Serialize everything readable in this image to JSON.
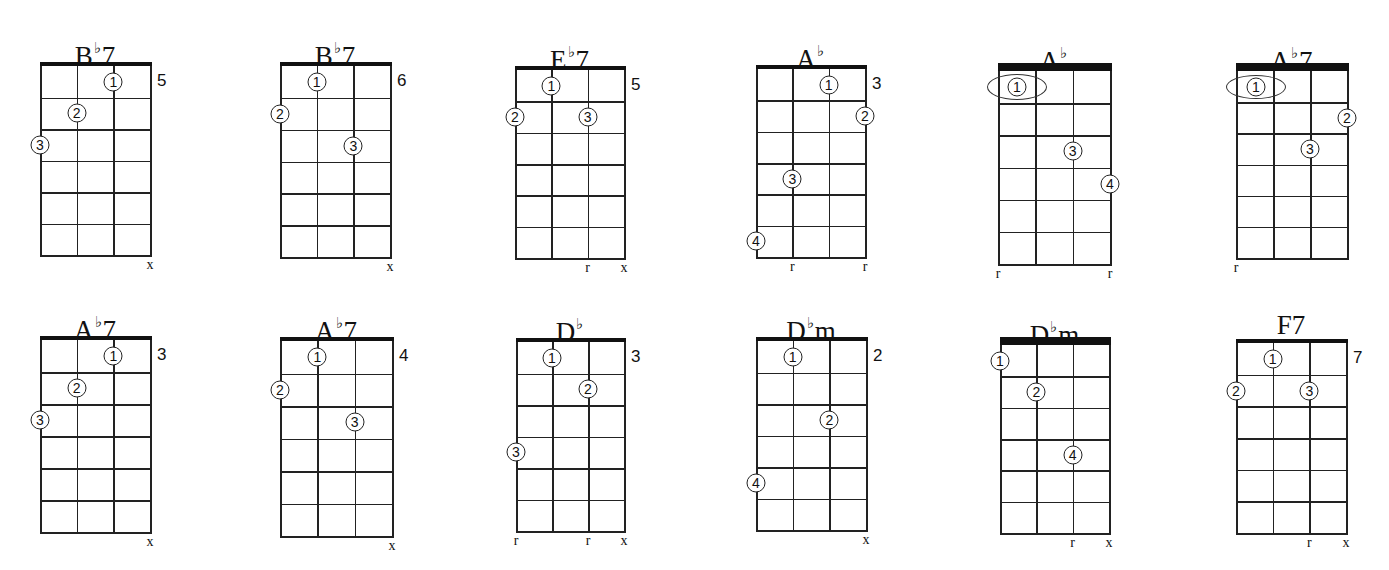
{
  "diagram": {
    "type": "ukulele-style chord chart grid",
    "strings": 4,
    "frets_shown": 6,
    "rows": 2,
    "columns": 6
  },
  "chords": [
    {
      "root": "B",
      "flat": true,
      "suffix": "7",
      "fret_label": "5",
      "grid": {
        "x0": 40,
        "x1": 150,
        "y0": 66,
        "y1": 255
      },
      "nut_thickness": 4,
      "fingers": [
        {
          "label": "1",
          "string": 3,
          "fret": 1
        },
        {
          "label": "2",
          "string": 2,
          "fret": 2
        },
        {
          "label": "3",
          "string": 1,
          "fret": 3
        }
      ],
      "markers": [
        {
          "string": 4,
          "text": "x"
        }
      ]
    },
    {
      "root": "B",
      "flat": true,
      "suffix": "7",
      "fret_label": "6",
      "grid": {
        "x0": 280,
        "x1": 390,
        "y0": 66,
        "y1": 257
      },
      "nut_thickness": 4,
      "fingers": [
        {
          "label": "1",
          "string": 2,
          "fret": 1
        },
        {
          "label": "2",
          "string": 1,
          "fret": 2
        },
        {
          "label": "3",
          "string": 3,
          "fret": 3
        }
      ],
      "markers": [
        {
          "string": 4,
          "text": "x"
        }
      ]
    },
    {
      "root": "E",
      "flat": true,
      "suffix": "7",
      "fret_label": "5",
      "grid": {
        "x0": 515,
        "x1": 624,
        "y0": 70,
        "y1": 258
      },
      "nut_thickness": 4,
      "fingers": [
        {
          "label": "1",
          "string": 2,
          "fret": 1
        },
        {
          "label": "2",
          "string": 1,
          "fret": 2
        },
        {
          "label": "3",
          "string": 3,
          "fret": 2
        }
      ],
      "markers": [
        {
          "string": 3,
          "text": "r"
        },
        {
          "string": 4,
          "text": "x"
        }
      ]
    },
    {
      "root": "A",
      "flat": true,
      "suffix": "",
      "fret_label": "3",
      "grid": {
        "x0": 756,
        "x1": 865,
        "y0": 69,
        "y1": 257
      },
      "nut_thickness": 4,
      "fingers": [
        {
          "label": "1",
          "string": 3,
          "fret": 1
        },
        {
          "label": "2",
          "string": 4,
          "fret": 2
        },
        {
          "label": "3",
          "string": 2,
          "fret": 4
        },
        {
          "label": "4",
          "string": 1,
          "fret": 6
        }
      ],
      "markers": [
        {
          "string": 2,
          "text": "r"
        },
        {
          "string": 4,
          "text": "r"
        }
      ]
    },
    {
      "root": "A",
      "flat": true,
      "suffix": "",
      "fret_label": "",
      "grid": {
        "x0": 998,
        "x1": 1110,
        "y0": 71,
        "y1": 264
      },
      "nut_thickness": 8,
      "barre": {
        "fret": 1,
        "cx": 1017,
        "w": 60,
        "h": 26
      },
      "fingers": [
        {
          "label": "1",
          "string": 1,
          "fret": 1,
          "offset_x": 19
        },
        {
          "label": "3",
          "string": 3,
          "fret": 3
        },
        {
          "label": "4",
          "string": 4,
          "fret": 4
        }
      ],
      "markers": [
        {
          "string": 1,
          "text": "r"
        },
        {
          "string": 4,
          "text": "r"
        }
      ]
    },
    {
      "root": "A",
      "flat": true,
      "suffix": "7",
      "fret_label": "",
      "grid": {
        "x0": 1236,
        "x1": 1347,
        "y0": 71,
        "y1": 258
      },
      "nut_thickness": 8,
      "barre": {
        "fret": 1,
        "cx": 1256,
        "w": 60,
        "h": 24
      },
      "fingers": [
        {
          "label": "1",
          "string": 1,
          "fret": 1,
          "offset_x": 20
        },
        {
          "label": "2",
          "string": 4,
          "fret": 2
        },
        {
          "label": "3",
          "string": 3,
          "fret": 3
        }
      ],
      "markers": [
        {
          "string": 1,
          "text": "r"
        }
      ]
    },
    {
      "root": "A",
      "flat": true,
      "suffix": "7",
      "fret_label": "3",
      "grid": {
        "x0": 40,
        "x1": 150,
        "y0": 340,
        "y1": 532
      },
      "nut_thickness": 4,
      "fingers": [
        {
          "label": "1",
          "string": 3,
          "fret": 1
        },
        {
          "label": "2",
          "string": 2,
          "fret": 2
        },
        {
          "label": "3",
          "string": 1,
          "fret": 3
        }
      ],
      "markers": [
        {
          "string": 4,
          "text": "x"
        }
      ]
    },
    {
      "root": "A",
      "flat": true,
      "suffix": "7",
      "fret_label": "4",
      "grid": {
        "x0": 280,
        "x1": 392,
        "y0": 341,
        "y1": 536
      },
      "nut_thickness": 4,
      "fingers": [
        {
          "label": "1",
          "string": 2,
          "fret": 1
        },
        {
          "label": "2",
          "string": 1,
          "fret": 2
        },
        {
          "label": "3",
          "string": 3,
          "fret": 3
        }
      ],
      "markers": [
        {
          "string": 4,
          "text": "x"
        }
      ]
    },
    {
      "root": "D",
      "flat": true,
      "suffix": "",
      "fret_label": "3",
      "grid": {
        "x0": 516,
        "x1": 624,
        "y0": 342,
        "y1": 531
      },
      "nut_thickness": 4,
      "fingers": [
        {
          "label": "1",
          "string": 2,
          "fret": 1
        },
        {
          "label": "2",
          "string": 3,
          "fret": 2
        },
        {
          "label": "3",
          "string": 1,
          "fret": 4
        }
      ],
      "markers": [
        {
          "string": 1,
          "text": "r"
        },
        {
          "string": 3,
          "text": "r"
        },
        {
          "string": 4,
          "text": "x"
        }
      ]
    },
    {
      "root": "D",
      "flat": true,
      "suffix": "m",
      "fret_label": "2",
      "grid": {
        "x0": 756,
        "x1": 866,
        "y0": 341,
        "y1": 530
      },
      "nut_thickness": 4,
      "fingers": [
        {
          "label": "1",
          "string": 2,
          "fret": 1
        },
        {
          "label": "2",
          "string": 3,
          "fret": 3
        },
        {
          "label": "4",
          "string": 1,
          "fret": 5
        }
      ],
      "markers": [
        {
          "string": 4,
          "text": "x"
        }
      ]
    },
    {
      "root": "D",
      "flat": true,
      "suffix": "m",
      "fret_label": "",
      "grid": {
        "x0": 1000,
        "x1": 1109,
        "y0": 345,
        "y1": 533
      },
      "nut_thickness": 8,
      "fingers": [
        {
          "label": "1",
          "string": 1,
          "fret": 1
        },
        {
          "label": "2",
          "string": 2,
          "fret": 2
        },
        {
          "label": "4",
          "string": 3,
          "fret": 4
        }
      ],
      "markers": [
        {
          "string": 3,
          "text": "r"
        },
        {
          "string": 4,
          "text": "x"
        }
      ]
    },
    {
      "root": "F",
      "flat": false,
      "suffix": "7",
      "fret_label": "7",
      "grid": {
        "x0": 1236,
        "x1": 1346,
        "y0": 343,
        "y1": 533
      },
      "nut_thickness": 4,
      "fingers": [
        {
          "label": "1",
          "string": 2,
          "fret": 1
        },
        {
          "label": "2",
          "string": 1,
          "fret": 2
        },
        {
          "label": "3",
          "string": 3,
          "fret": 2
        }
      ],
      "markers": [
        {
          "string": 3,
          "text": "r"
        },
        {
          "string": 4,
          "text": "x"
        }
      ]
    }
  ],
  "symbols": {
    "flat": "♭",
    "circled": [
      "①",
      "②",
      "③",
      "④"
    ]
  }
}
